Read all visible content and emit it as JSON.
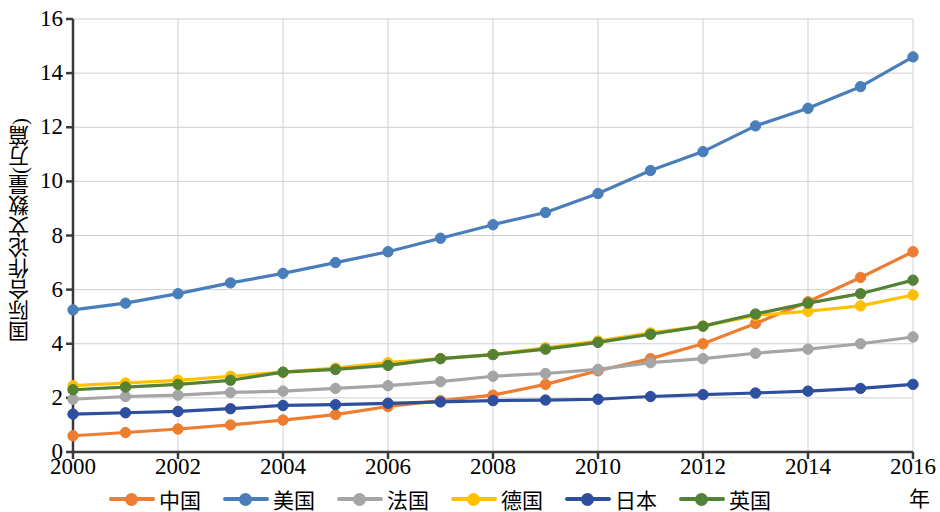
{
  "chart_data": {
    "type": "line",
    "title": "",
    "xlabel": "年",
    "ylabel": "国际合作论文数量(万篇)",
    "x": [
      2000,
      2001,
      2002,
      2003,
      2004,
      2005,
      2006,
      2007,
      2008,
      2009,
      2010,
      2011,
      2012,
      2013,
      2014,
      2015,
      2016
    ],
    "xtick_labels": [
      "2000",
      "2002",
      "2004",
      "2006",
      "2008",
      "2010",
      "2012",
      "2014",
      "2016"
    ],
    "xticks": [
      2000,
      2002,
      2004,
      2006,
      2008,
      2010,
      2012,
      2014,
      2016
    ],
    "ytick_labels": [
      "0",
      "2",
      "4",
      "6",
      "8",
      "10",
      "12",
      "14",
      "16"
    ],
    "yticks": [
      0,
      2,
      4,
      6,
      8,
      10,
      12,
      14,
      16
    ],
    "xlim": [
      2000,
      2016
    ],
    "ylim": [
      0,
      16
    ],
    "grid": true,
    "legend_position": "bottom",
    "markers": "circle",
    "series": [
      {
        "name": "中国",
        "color": "#ED7D31",
        "values": [
          0.6,
          0.72,
          0.85,
          1.0,
          1.18,
          1.38,
          1.68,
          1.9,
          2.1,
          2.5,
          3.0,
          3.45,
          4.0,
          4.75,
          5.55,
          6.45,
          7.4
        ]
      },
      {
        "name": "美国",
        "color": "#4A7EBB",
        "values": [
          5.25,
          5.5,
          5.85,
          6.25,
          6.6,
          7.0,
          7.4,
          7.9,
          8.4,
          8.85,
          9.55,
          10.4,
          11.1,
          12.05,
          12.7,
          13.5,
          14.6
        ]
      },
      {
        "name": "法国",
        "color": "#A5A5A5",
        "values": [
          1.95,
          2.05,
          2.1,
          2.2,
          2.25,
          2.35,
          2.45,
          2.6,
          2.8,
          2.9,
          3.05,
          3.3,
          3.45,
          3.65,
          3.8,
          4.0,
          4.25
        ]
      },
      {
        "name": "德国",
        "color": "#FFC000",
        "values": [
          2.45,
          2.55,
          2.65,
          2.8,
          2.95,
          3.1,
          3.3,
          3.45,
          3.6,
          3.85,
          4.1,
          4.4,
          4.65,
          5.05,
          5.2,
          5.4,
          5.8
        ]
      },
      {
        "name": "日本",
        "color": "#2E4E9E",
        "values": [
          1.4,
          1.45,
          1.5,
          1.6,
          1.72,
          1.75,
          1.8,
          1.85,
          1.9,
          1.92,
          1.95,
          2.05,
          2.12,
          2.18,
          2.25,
          2.35,
          2.5
        ]
      },
      {
        "name": "英国",
        "color": "#548235",
        "values": [
          2.3,
          2.4,
          2.5,
          2.65,
          2.95,
          3.05,
          3.2,
          3.45,
          3.6,
          3.8,
          4.05,
          4.35,
          4.65,
          5.1,
          5.5,
          5.85,
          6.35
        ]
      }
    ]
  },
  "axis": {
    "y_title": "国际合作论文数量(万篇)",
    "x_title": "年"
  },
  "legend": {
    "items": [
      {
        "label": "中国",
        "color": "#ED7D31"
      },
      {
        "label": "美国",
        "color": "#4A7EBB"
      },
      {
        "label": "法国",
        "color": "#A5A5A5"
      },
      {
        "label": "德国",
        "color": "#FFC000"
      },
      {
        "label": "日本",
        "color": "#2E4E9E"
      },
      {
        "label": "英国",
        "color": "#548235"
      }
    ]
  }
}
